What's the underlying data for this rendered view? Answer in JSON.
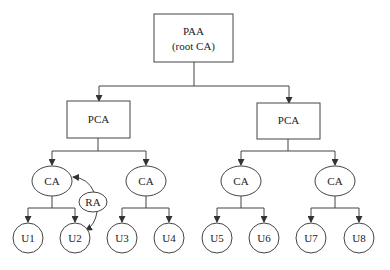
{
  "diagram": {
    "root": {
      "line1": "PAA",
      "line2": "(root CA)"
    },
    "pca_left": {
      "label": "PCA"
    },
    "pca_right": {
      "label": "PCA"
    },
    "ca1": {
      "label": "CA"
    },
    "ca2": {
      "label": "CA"
    },
    "ca3": {
      "label": "CA"
    },
    "ca4": {
      "label": "CA"
    },
    "ra": {
      "label": "RA"
    },
    "users": [
      "U1",
      "U2",
      "U3",
      "U4",
      "U5",
      "U6",
      "U7",
      "U8"
    ],
    "edges": [
      [
        "PAA",
        "PCA-left"
      ],
      [
        "PAA",
        "PCA-right"
      ],
      [
        "PCA-left",
        "CA1"
      ],
      [
        "PCA-left",
        "CA2"
      ],
      [
        "PCA-right",
        "CA3"
      ],
      [
        "PCA-right",
        "CA4"
      ],
      [
        "CA1",
        "U1"
      ],
      [
        "CA1",
        "U2"
      ],
      [
        "CA2",
        "U3"
      ],
      [
        "CA2",
        "U4"
      ],
      [
        "CA3",
        "U5"
      ],
      [
        "CA3",
        "U6"
      ],
      [
        "CA4",
        "U7"
      ],
      [
        "CA4",
        "U8"
      ],
      [
        "RA",
        "CA1"
      ],
      [
        "RA",
        "U2"
      ]
    ]
  }
}
